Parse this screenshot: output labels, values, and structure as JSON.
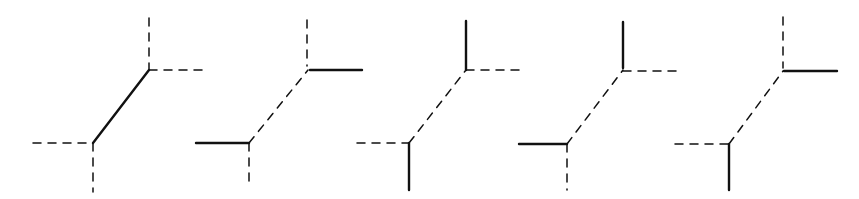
{
  "diagram": {
    "title": "",
    "stroke_color": "#111111",
    "background": "#ffffff",
    "figures": [
      {
        "id": "figure-1",
        "upper_junction": [
          149,
          70
        ],
        "lower_junction": [
          93,
          143
        ],
        "edges": [
          {
            "name": "upper-vertical",
            "from": [
              149,
              18
            ],
            "to": [
              149,
              70
            ],
            "style": "dashed"
          },
          {
            "name": "upper-horizontal",
            "from": [
              149,
              70
            ],
            "to": [
              204,
              70
            ],
            "style": "dashed"
          },
          {
            "name": "diagonal",
            "from": [
              93,
              143
            ],
            "to": [
              149,
              70
            ],
            "style": "solid"
          },
          {
            "name": "lower-horizontal",
            "from": [
              33,
              143
            ],
            "to": [
              93,
              143
            ],
            "style": "dashed"
          },
          {
            "name": "lower-vertical",
            "from": [
              93,
              143
            ],
            "to": [
              93,
              192
            ],
            "style": "dashed"
          }
        ]
      },
      {
        "id": "figure-2",
        "upper_junction": [
          308,
          70
        ],
        "lower_junction": [
          249,
          143
        ],
        "edges": [
          {
            "name": "upper-vertical",
            "from": [
              307,
              20
            ],
            "to": [
              307,
              66
            ],
            "style": "dashed"
          },
          {
            "name": "upper-horizontal",
            "from": [
              310,
              70
            ],
            "to": [
              362,
              70
            ],
            "style": "solid"
          },
          {
            "name": "diagonal",
            "from": [
              249,
              143
            ],
            "to": [
              308,
              70
            ],
            "style": "dashed"
          },
          {
            "name": "lower-horizontal",
            "from": [
              196,
              143
            ],
            "to": [
              249,
              143
            ],
            "style": "solid"
          },
          {
            "name": "lower-vertical",
            "from": [
              249,
              143
            ],
            "to": [
              249,
              188
            ],
            "style": "dashed"
          }
        ]
      },
      {
        "id": "figure-3",
        "upper_junction": [
          466,
          70
        ],
        "lower_junction": [
          409,
          143
        ],
        "edges": [
          {
            "name": "upper-vertical",
            "from": [
              466,
              21
            ],
            "to": [
              466,
              70
            ],
            "style": "solid"
          },
          {
            "name": "upper-horizontal",
            "from": [
              466,
              70
            ],
            "to": [
              520,
              70
            ],
            "style": "dashed"
          },
          {
            "name": "diagonal",
            "from": [
              409,
              143
            ],
            "to": [
              466,
              70
            ],
            "style": "dashed"
          },
          {
            "name": "lower-horizontal",
            "from": [
              357,
              143
            ],
            "to": [
              409,
              143
            ],
            "style": "dashed"
          },
          {
            "name": "lower-vertical",
            "from": [
              409,
              143
            ],
            "to": [
              409,
              190
            ],
            "style": "solid"
          }
        ]
      },
      {
        "id": "figure-4",
        "upper_junction": [
          623,
          70
        ],
        "lower_junction": [
          567,
          144
        ],
        "edges": [
          {
            "name": "upper-vertical",
            "from": [
              623,
              22
            ],
            "to": [
              623,
              68
            ],
            "style": "solid"
          },
          {
            "name": "upper-horizontal",
            "from": [
              623,
              71
            ],
            "to": [
              680,
              71
            ],
            "style": "dashed"
          },
          {
            "name": "diagonal",
            "from": [
              567,
              144
            ],
            "to": [
              623,
              70
            ],
            "style": "dashed"
          },
          {
            "name": "lower-horizontal",
            "from": [
              519,
              144
            ],
            "to": [
              567,
              144
            ],
            "style": "solid"
          },
          {
            "name": "lower-vertical",
            "from": [
              567,
              144
            ],
            "to": [
              567,
              190
            ],
            "style": "dashed"
          }
        ]
      },
      {
        "id": "figure-5",
        "upper_junction": [
          783,
          70
        ],
        "lower_junction": [
          729,
          144
        ],
        "edges": [
          {
            "name": "upper-vertical",
            "from": [
              783,
              17
            ],
            "to": [
              783,
              68
            ],
            "style": "dashed"
          },
          {
            "name": "upper-horizontal",
            "from": [
              784,
              71
            ],
            "to": [
              837,
              71
            ],
            "style": "solid"
          },
          {
            "name": "diagonal",
            "from": [
              729,
              144
            ],
            "to": [
              783,
              71
            ],
            "style": "dashed"
          },
          {
            "name": "lower-horizontal",
            "from": [
              675,
              144
            ],
            "to": [
              729,
              144
            ],
            "style": "dashed"
          },
          {
            "name": "lower-vertical",
            "from": [
              729,
              144
            ],
            "to": [
              729,
              190
            ],
            "style": "solid"
          }
        ]
      }
    ]
  }
}
